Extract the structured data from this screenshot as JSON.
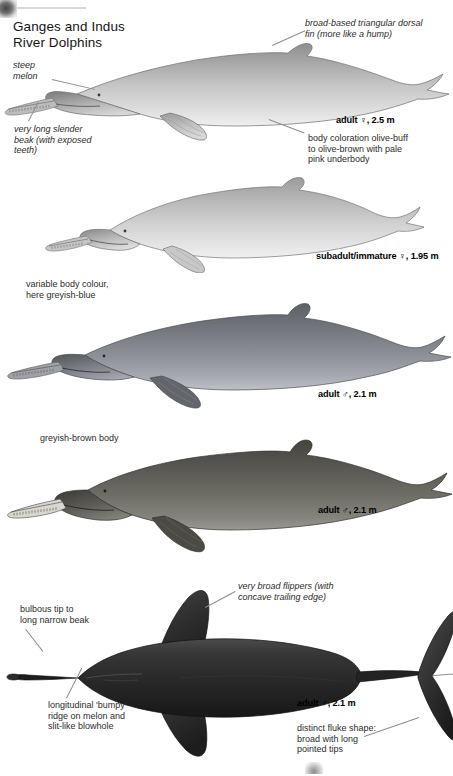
{
  "page": {
    "title": "Ganges and Indus\nRiver Dolphins",
    "background_color": "#ffffff",
    "width": 453,
    "height": 776
  },
  "annotations": [
    {
      "id": "steep-melon",
      "text": "steep\nmelon",
      "style": "italic"
    },
    {
      "id": "long-beak",
      "text": "very long slender\nbeak (with exposed\nteeth)",
      "style": "italic"
    },
    {
      "id": "dorsal-fin",
      "text": "broad-based triangular dorsal\nfin (more like a hump)",
      "style": "italic"
    },
    {
      "id": "body-coloration",
      "text": "body coloration olive-buff\nto olive-brown with pale\npink underbody",
      "style": "roman"
    },
    {
      "id": "variable-colour",
      "text": "variable body colour,\nhere greyish-blue",
      "style": "roman"
    },
    {
      "id": "greyish-brown",
      "text": "greyish-brown body",
      "style": "roman"
    },
    {
      "id": "broad-flippers",
      "text": "very broad flippers (with\nconcave trailing edge)",
      "style": "italic"
    },
    {
      "id": "bulbous-tip",
      "text": "bulbous tip to\nlong narrow beak",
      "style": "roman"
    },
    {
      "id": "bumpy-ridge",
      "text": "longitudinal 'bumpy'\nridge on melon and\nslit-like blowhole",
      "style": "roman"
    },
    {
      "id": "fluke-shape",
      "text": "distinct fluke shape:\nbroad with long\npointed tips",
      "style": "roman"
    }
  ],
  "specimens": [
    {
      "id": "specimen-1",
      "caption": "adult ♀, 2.5 m",
      "age": "adult",
      "sex": "female",
      "length_m": 2.5,
      "view": "lateral",
      "color": "olive-buff pale grey"
    },
    {
      "id": "specimen-2",
      "caption": "subadult/immature ♀, 1.95 m",
      "age": "subadult/immature",
      "sex": "female",
      "length_m": 1.95,
      "view": "lateral",
      "color": "pale grey"
    },
    {
      "id": "specimen-3",
      "caption": "adult ♂, 2.1 m",
      "age": "adult",
      "sex": "male",
      "length_m": 2.1,
      "view": "lateral",
      "color": "greyish-blue"
    },
    {
      "id": "specimen-4",
      "caption": "adult ♂, 2.1 m",
      "age": "adult",
      "sex": "male",
      "length_m": 2.1,
      "view": "lateral",
      "color": "greyish-brown"
    },
    {
      "id": "specimen-5",
      "caption": "adult ♂, 2.1 m",
      "age": "adult",
      "sex": "male",
      "length_m": 2.1,
      "view": "dorsal",
      "color": "dark grey-black"
    }
  ]
}
